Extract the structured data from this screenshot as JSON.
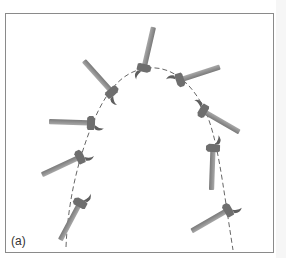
{
  "figure": {
    "panel_label": "(a)",
    "colors": {
      "frame": "#8a8a8a",
      "hammer_handle": "#8c8c8c",
      "hammer_head": "#6e6e6e",
      "path": "#555555",
      "background": "#ffffff"
    },
    "hammers": [
      {
        "id": 1,
        "x": 66,
        "y": 228,
        "angle": -55
      },
      {
        "id": 2,
        "x": 78,
        "y": 168,
        "angle": -25
      },
      {
        "id": 3,
        "x": 90,
        "y": 125,
        "angle": 5
      },
      {
        "id": 4,
        "x": 112,
        "y": 90,
        "angle": 40
      },
      {
        "id": 5,
        "x": 147,
        "y": 68,
        "angle": 75
      },
      {
        "id": 6,
        "x": 182,
        "y": 86,
        "angle": 160
      },
      {
        "id": 7,
        "x": 205,
        "y": 113,
        "angle": 205
      },
      {
        "id": 8,
        "x": 213,
        "y": 152,
        "angle": 270
      },
      {
        "id": 9,
        "x": 232,
        "y": 211,
        "angle": 235
      }
    ]
  }
}
